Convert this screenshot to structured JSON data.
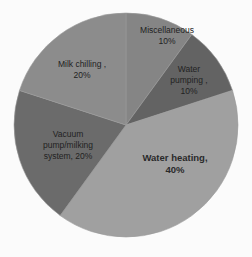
{
  "chart_data": {
    "type": "pie",
    "title": "",
    "start_angle_deg": 0,
    "direction": "clockwise",
    "categories": [
      "Miscellaneous",
      "Water pumping",
      "Water heating",
      "Vacuum pump/milking system",
      "Milk chilling"
    ],
    "values": [
      10,
      10,
      40,
      20,
      20
    ],
    "unit": "%",
    "colors": [
      "#858585",
      "#636363",
      "#a0a0a0",
      "#6b6b6b",
      "#8c8c8c"
    ],
    "legend": "none",
    "data_labels": [
      "Miscellaneous\n10%",
      "Water\npumping ,\n10%",
      "Water heating,\n40%",
      "Vacuum\npump/milking\nsystem, 20%",
      "Milk chilling ,\n20%"
    ]
  },
  "geometry": {
    "cx": 126,
    "cy": 125,
    "r": 112
  },
  "labels": {
    "misc": "Miscellaneous\n10%",
    "pumping": "Water\npumping ,\n10%",
    "heating": "Water heating,\n40%",
    "vacuum": "Vacuum\npump/milking\nsystem, 20%",
    "chilling": "Milk chilling ,\n20%"
  }
}
